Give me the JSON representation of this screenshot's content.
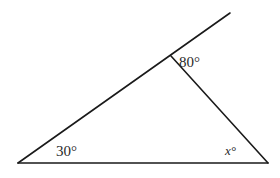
{
  "diagram": {
    "type": "triangle-with-extended-side",
    "stroke_color": "#1a1a1a",
    "stroke_width": 1.6,
    "points": {
      "A": {
        "x": 18,
        "y": 163
      },
      "B": {
        "x": 171,
        "y": 56
      },
      "C": {
        "x": 268,
        "y": 163
      },
      "E": {
        "x": 230,
        "y": 13
      }
    },
    "segments": [
      {
        "name": "side-AE-extended",
        "from": "A",
        "to": "E"
      },
      {
        "name": "side-BC",
        "from": "B",
        "to": "C"
      },
      {
        "name": "side-AC",
        "from": "A",
        "to": "C"
      }
    ],
    "labels": {
      "angle_A": "30°",
      "angle_B_exterior": "80°",
      "angle_C": "x°"
    }
  }
}
